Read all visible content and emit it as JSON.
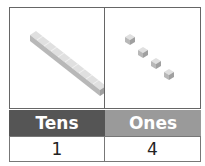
{
  "headers": [
    "Tens",
    "Ones"
  ],
  "values": [
    "1",
    "4"
  ],
  "colors": {
    "tens_header": "#555555",
    "ones_header": "#9a9a9a",
    "block": "#c8c8c8"
  },
  "blocks": {
    "tens_rods": 1,
    "ones_cubes": 4
  }
}
